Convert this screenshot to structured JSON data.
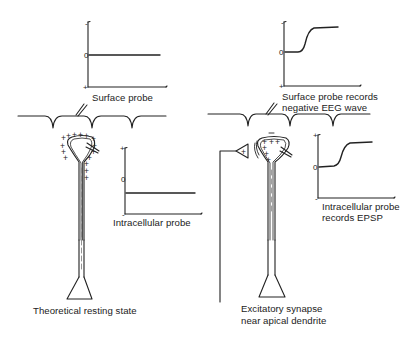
{
  "diagram": {
    "left_panel": {
      "surface_graph": {
        "tick_top": "-",
        "tick_zero": "0",
        "tick_bottom": "+",
        "trace": "flat line at zero"
      },
      "surface_probe_label": "Surface probe",
      "intracellular_graph": {
        "tick_top": "+",
        "tick_zero": "0",
        "tick_bottom": "-",
        "trace": "flat line below zero (resting potential)"
      },
      "intracellular_label": "Intracellular probe",
      "caption": "Theoretical resting state"
    },
    "right_panel": {
      "surface_graph": {
        "tick_top": "-",
        "tick_zero": "0",
        "tick_bottom": "+",
        "trace": "sigmoid rise toward negative"
      },
      "surface_probe_label_line1": "Surface probe records",
      "surface_probe_label_line2": "negative EEG wave",
      "amplifier_symbol": "+",
      "intracellular_graph": {
        "tick_top": "+",
        "tick_zero": "0",
        "tick_bottom": "-",
        "trace": "sigmoid rise toward positive (EPSP)"
      },
      "intracellular_label_line1": "Intracellular probe",
      "intracellular_label_line2": "records EPSP",
      "caption_line1": "Excitatory synapse",
      "caption_line2": "near apical dendrite"
    },
    "colors": {
      "ink": "#222222",
      "dashed": "#888888",
      "background": "#ffffff"
    }
  }
}
